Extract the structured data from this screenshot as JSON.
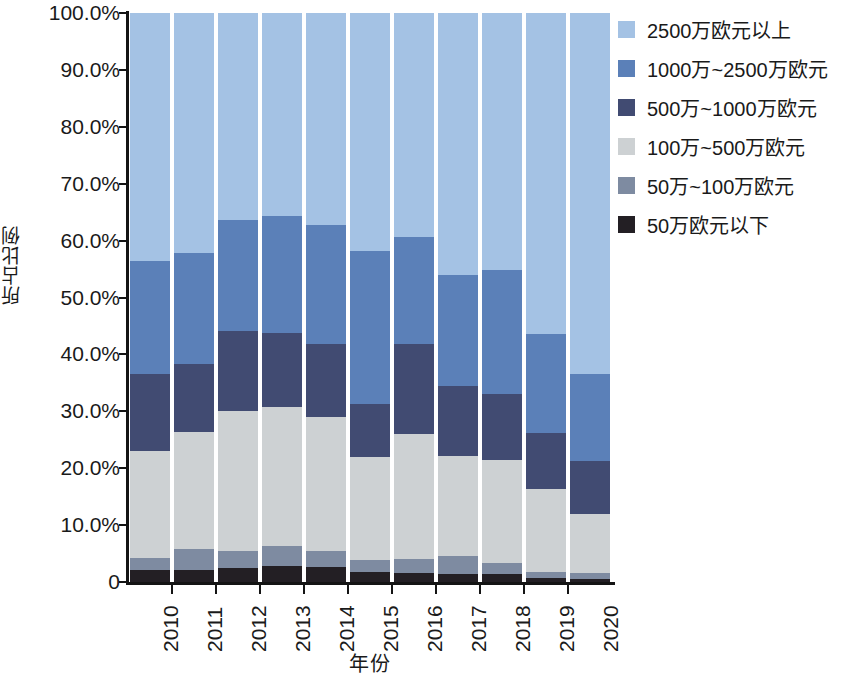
{
  "chart_data": {
    "type": "bar",
    "stacked": true,
    "stack_mode": "percent",
    "title": "",
    "xlabel": "年份",
    "ylabel": "所占比例",
    "grid": false,
    "legend_position": "right",
    "ylim": [
      0,
      100
    ],
    "ytick_labels": [
      "0",
      "10.0%",
      "20.0%",
      "30.0%",
      "40.0%",
      "50.0%",
      "60.0%",
      "70.0%",
      "80.0%",
      "90.0%",
      "100.0%"
    ],
    "ytick_values": [
      0,
      10,
      20,
      30,
      40,
      50,
      60,
      70,
      80,
      90,
      100
    ],
    "categories": [
      "2010",
      "2011",
      "2012",
      "2013",
      "2014",
      "2015",
      "2016",
      "2017",
      "2018",
      "2019",
      "2020"
    ],
    "series": [
      {
        "name": "50万欧元以下",
        "color": "#231f24",
        "values": [
          2.1,
          2.1,
          2.5,
          2.8,
          2.6,
          1.8,
          1.6,
          1.4,
          1.4,
          0.7,
          0.6
        ]
      },
      {
        "name": "50万~100万欧元",
        "color": "#7e8ba1",
        "values": [
          2.1,
          3.7,
          3.0,
          3.5,
          2.8,
          2.0,
          2.4,
          3.2,
          1.9,
          1.1,
          0.9
        ]
      },
      {
        "name": "100万~500万欧元",
        "color": "#cdd1d3",
        "values": [
          18.9,
          20.6,
          24.6,
          24.5,
          23.6,
          18.1,
          22.0,
          17.6,
          18.2,
          14.6,
          10.4
        ]
      },
      {
        "name": "500万~1000万欧元",
        "color": "#414b72",
        "values": [
          13.5,
          12.0,
          14.1,
          13.0,
          12.8,
          9.4,
          15.8,
          12.3,
          11.6,
          9.7,
          9.3
        ]
      },
      {
        "name": "1000万~2500万欧元",
        "color": "#5b80b8",
        "values": [
          19.9,
          19.5,
          19.5,
          20.5,
          21.0,
          26.9,
          18.8,
          19.5,
          21.7,
          17.5,
          15.3
        ]
      },
      {
        "name": "2500万欧元以上",
        "color": "#a4c2e4",
        "values": [
          43.5,
          42.1,
          36.3,
          35.7,
          37.2,
          41.8,
          39.4,
          46.0,
          45.2,
          56.4,
          63.5
        ]
      }
    ],
    "legend_entries": [
      {
        "label": "2500万欧元以上",
        "color": "#a4c2e4"
      },
      {
        "label": "1000万~2500万欧元",
        "color": "#5b80b8"
      },
      {
        "label": "500万~1000万欧元",
        "color": "#414b72"
      },
      {
        "label": "100万~500万欧元",
        "color": "#cdd1d3"
      },
      {
        "label": "50万~100万欧元",
        "color": "#7e8ba1"
      },
      {
        "label": "50万欧元以下",
        "color": "#231f24"
      }
    ]
  }
}
